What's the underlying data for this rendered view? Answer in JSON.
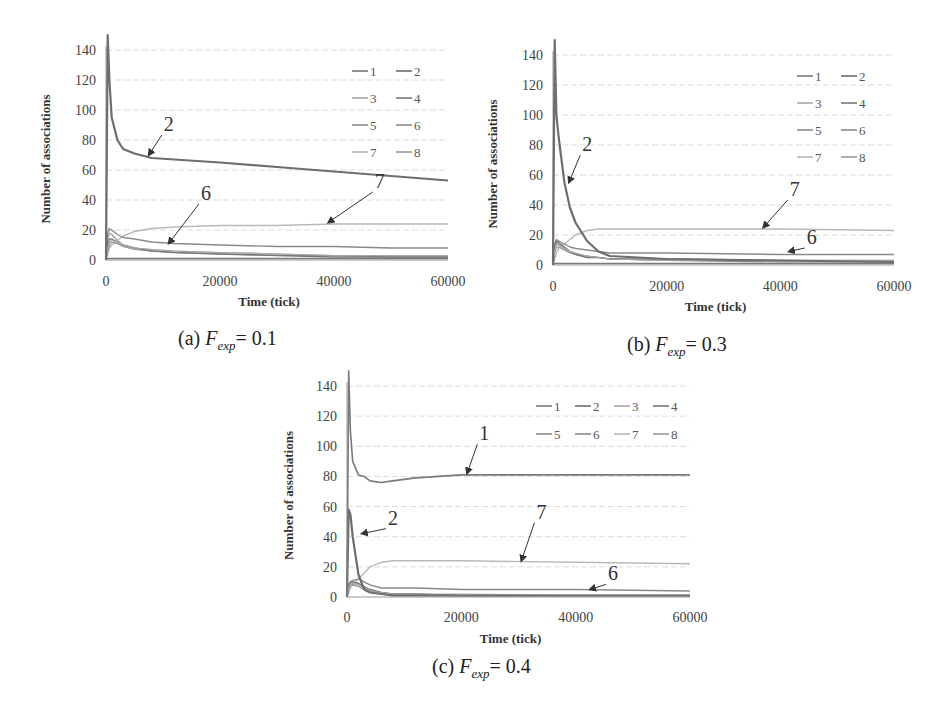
{
  "figure": {
    "header_fragment": "",
    "panels": [
      {
        "id": "a",
        "caption_prefix": "(a) ",
        "caption_var": "F",
        "caption_sub": "exp",
        "caption_value": "= 0.1"
      },
      {
        "id": "b",
        "caption_prefix": "(b) ",
        "caption_var": "F",
        "caption_sub": "exp",
        "caption_value": "= 0.3"
      },
      {
        "id": "c",
        "caption_prefix": "(c) ",
        "caption_var": "F",
        "caption_sub": "exp",
        "caption_value": "= 0.4"
      }
    ]
  },
  "chart_data": [
    {
      "type": "line",
      "title": "(a) F_exp = 0.1",
      "xlabel": "Time (tick)",
      "ylabel": "Number of associations",
      "xlim": [
        0,
        60000
      ],
      "ylim": [
        0,
        140
      ],
      "xticks": [
        0,
        20000,
        40000,
        60000
      ],
      "yticks": [
        0,
        20,
        40,
        60,
        80,
        100,
        120,
        140
      ],
      "grid": true,
      "legend": {
        "position": "upper right",
        "columns": 2,
        "entries": [
          "1",
          "2",
          "3",
          "4",
          "5",
          "6",
          "7",
          "8"
        ]
      },
      "annotations": [
        {
          "text": "2",
          "label_at": [
            10500,
            86
          ],
          "arrow_to": [
            7500,
            70
          ]
        },
        {
          "text": "6",
          "label_at": [
            17000,
            40
          ],
          "arrow_to": [
            11000,
            11
          ]
        },
        {
          "text": "7",
          "label_at": [
            47500,
            48
          ],
          "arrow_to": [
            39000,
            25
          ]
        }
      ],
      "x": [
        0,
        300,
        600,
        1000,
        2000,
        3000,
        5000,
        8000,
        12000,
        20000,
        30000,
        40000,
        50000,
        60000
      ],
      "series": [
        {
          "name": "1",
          "values": [
            0,
            1,
            1,
            1,
            1,
            1,
            1,
            1,
            1,
            1,
            1,
            1,
            1,
            1
          ]
        },
        {
          "name": "2",
          "values": [
            0,
            150,
            120,
            95,
            80,
            74,
            71,
            68,
            67,
            65,
            62,
            59,
            56,
            53
          ]
        },
        {
          "name": "3",
          "values": [
            0,
            8,
            12,
            13,
            12,
            10,
            8,
            7,
            6,
            5,
            4,
            3,
            3,
            3
          ]
        },
        {
          "name": "4",
          "values": [
            0,
            10,
            14,
            14,
            12,
            10,
            8,
            6,
            5,
            4,
            3,
            2,
            2,
            2
          ]
        },
        {
          "name": "5",
          "values": [
            0,
            6,
            10,
            12,
            11,
            9,
            7,
            6,
            5,
            4,
            3,
            3,
            2,
            2
          ]
        },
        {
          "name": "6",
          "values": [
            0,
            18,
            21,
            20,
            17,
            15,
            14,
            12,
            11,
            10,
            9,
            9,
            8,
            8
          ]
        },
        {
          "name": "7",
          "values": [
            0,
            4,
            8,
            10,
            13,
            16,
            19,
            21,
            22,
            23,
            23,
            24,
            24,
            24
          ]
        },
        {
          "name": "8",
          "values": [
            0,
            14,
            18,
            17,
            13,
            10,
            8,
            7,
            6,
            5,
            4,
            3,
            3,
            3
          ]
        }
      ]
    },
    {
      "type": "line",
      "title": "(b) F_exp = 0.3",
      "xlabel": "Time (tick)",
      "ylabel": "Number of associations",
      "xlim": [
        0,
        60000
      ],
      "ylim": [
        0,
        140
      ],
      "xticks": [
        0,
        20000,
        40000,
        60000
      ],
      "yticks": [
        0,
        20,
        40,
        60,
        80,
        100,
        120,
        140
      ],
      "grid": true,
      "legend": {
        "position": "upper right",
        "columns": 2,
        "entries": [
          "1",
          "2",
          "3",
          "4",
          "5",
          "6",
          "7",
          "8"
        ]
      },
      "annotations": [
        {
          "text": "2",
          "label_at": [
            5500,
            76
          ],
          "arrow_to": [
            2800,
            55
          ]
        },
        {
          "text": "7",
          "label_at": [
            42000,
            46
          ],
          "arrow_to": [
            37000,
            25
          ]
        },
        {
          "text": "6",
          "label_at": [
            45000,
            14
          ],
          "arrow_to": [
            41500,
            9
          ]
        }
      ],
      "x": [
        0,
        300,
        600,
        1000,
        2000,
        3000,
        4000,
        6000,
        8000,
        10000,
        20000,
        40000,
        60000
      ],
      "series": [
        {
          "name": "1",
          "values": [
            0,
            1,
            1,
            1,
            1,
            1,
            1,
            1,
            1,
            1,
            1,
            1,
            1
          ]
        },
        {
          "name": "2",
          "values": [
            0,
            150,
            100,
            85,
            55,
            38,
            28,
            16,
            9,
            6,
            4,
            3,
            2
          ]
        },
        {
          "name": "3",
          "values": [
            0,
            10,
            14,
            13,
            11,
            9,
            8,
            6,
            5,
            4,
            3,
            3,
            3
          ]
        },
        {
          "name": "4",
          "values": [
            0,
            12,
            16,
            15,
            12,
            9,
            7,
            5,
            5,
            4,
            4,
            3,
            3
          ]
        },
        {
          "name": "5",
          "values": [
            0,
            8,
            12,
            12,
            10,
            8,
            7,
            6,
            5,
            4,
            3,
            2,
            2
          ]
        },
        {
          "name": "6",
          "values": [
            0,
            14,
            17,
            16,
            14,
            12,
            11,
            10,
            9,
            8,
            8,
            7,
            7
          ]
        },
        {
          "name": "7",
          "values": [
            0,
            4,
            8,
            11,
            14,
            17,
            20,
            23,
            24,
            24,
            24,
            24,
            23
          ]
        },
        {
          "name": "8",
          "values": [
            0,
            12,
            15,
            14,
            11,
            9,
            7,
            6,
            5,
            4,
            3,
            3,
            3
          ]
        }
      ]
    },
    {
      "type": "line",
      "title": "(c) F_exp = 0.4",
      "xlabel": "Time (tick)",
      "ylabel": "Number of associations",
      "xlim": [
        0,
        60000
      ],
      "ylim": [
        0,
        140
      ],
      "xticks": [
        0,
        20000,
        40000,
        60000
      ],
      "yticks": [
        0,
        20,
        40,
        60,
        80,
        100,
        120,
        140
      ],
      "grid": true,
      "legend": {
        "position": "upper right",
        "columns": 4,
        "entries": [
          "1",
          "2",
          "3",
          "4",
          "5",
          "6",
          "7",
          "8"
        ]
      },
      "annotations": [
        {
          "text": "1",
          "label_at": [
            23500,
            104
          ],
          "arrow_to": [
            21000,
            82
          ]
        },
        {
          "text": "2",
          "label_at": [
            7500,
            48
          ],
          "arrow_to": [
            2600,
            42
          ]
        },
        {
          "text": "7",
          "label_at": [
            33500,
            52
          ],
          "arrow_to": [
            30500,
            24
          ]
        },
        {
          "text": "6",
          "label_at": [
            46000,
            11
          ],
          "arrow_to": [
            42500,
            5
          ]
        }
      ],
      "x": [
        0,
        300,
        600,
        1000,
        2000,
        3000,
        4000,
        6000,
        8000,
        12000,
        20000,
        40000,
        60000
      ],
      "series": [
        {
          "name": "1",
          "values": [
            0,
            150,
            110,
            90,
            81,
            80,
            77,
            76,
            77,
            79,
            81,
            81,
            81
          ]
        },
        {
          "name": "2",
          "values": [
            0,
            58,
            55,
            40,
            15,
            5,
            3,
            2,
            1,
            1,
            1,
            1,
            1
          ]
        },
        {
          "name": "3",
          "values": [
            0,
            6,
            9,
            9,
            8,
            6,
            4,
            3,
            2,
            2,
            2,
            1,
            1
          ]
        },
        {
          "name": "4",
          "values": [
            0,
            8,
            10,
            10,
            9,
            7,
            5,
            3,
            2,
            2,
            1,
            1,
            1
          ]
        },
        {
          "name": "5",
          "values": [
            0,
            5,
            8,
            8,
            7,
            5,
            4,
            3,
            2,
            2,
            1,
            1,
            1
          ]
        },
        {
          "name": "6",
          "values": [
            0,
            8,
            10,
            11,
            12,
            10,
            8,
            6,
            6,
            6,
            5,
            5,
            4
          ]
        },
        {
          "name": "7",
          "values": [
            0,
            3,
            6,
            8,
            12,
            16,
            20,
            23,
            24,
            24,
            24,
            23,
            22
          ]
        },
        {
          "name": "8",
          "values": [
            0,
            7,
            9,
            10,
            9,
            6,
            4,
            3,
            2,
            2,
            1,
            1,
            1
          ]
        }
      ]
    }
  ],
  "style": {
    "series_colors": [
      "#7a7a7a",
      "#6e6e6e",
      "#a9a9a9",
      "#777777",
      "#8c8c8c",
      "#8a8a8a",
      "#b8b8b8",
      "#9a9a9a"
    ],
    "series_widths": [
      1.6,
      2.2,
      1.2,
      1.4,
      1.2,
      1.4,
      1.4,
      1.2
    ],
    "grid_color": "#dcdcdc",
    "axis_color": "#999999",
    "tick_text_color": "#444444",
    "arrow_color": "#333333"
  },
  "layout": [
    {
      "x0": 106,
      "y0": 260,
      "x1": 448,
      "y1": 50,
      "legend_x": 352,
      "legend_y": 75,
      "legend_dx": 44,
      "legend_dy": 27,
      "ylabel_x": 50,
      "xlabel_y": 306,
      "xtick_y": 286
    },
    {
      "x0": 553,
      "y0": 265,
      "x1": 894,
      "y1": 55,
      "legend_x": 797,
      "legend_y": 80,
      "legend_dx": 44,
      "legend_dy": 27,
      "ylabel_x": 497,
      "xlabel_y": 311,
      "xtick_y": 291
    },
    {
      "x0": 347,
      "y0": 597,
      "x1": 690,
      "y1": 386,
      "legend_x": 536,
      "legend_y": 410,
      "legend_dx": 39,
      "legend_dy": 28,
      "ylabel_x": 293,
      "xlabel_y": 643,
      "xtick_y": 622
    }
  ],
  "caption_positions": [
    {
      "left": 178,
      "top": 327
    },
    {
      "left": 627,
      "top": 333
    },
    {
      "left": 432,
      "top": 655
    }
  ]
}
